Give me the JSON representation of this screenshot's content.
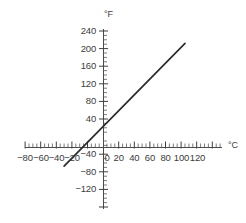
{
  "chart_data": {
    "type": "line",
    "title": "",
    "subtitle": "",
    "xlabel": "°C",
    "ylabel": "°F",
    "xlim": [
      -90,
      130
    ],
    "ylim": [
      -130,
      250
    ],
    "grid": false,
    "legend": null,
    "x_ticks": [
      -80,
      -60,
      -40,
      -20,
      0,
      20,
      40,
      60,
      80,
      100,
      120
    ],
    "x_tick_labels": [
      "−80",
      "−60",
      "−40",
      "−20",
      "0",
      "20",
      "40",
      "60",
      "80",
      "100",
      "120"
    ],
    "x_minor_step": 5,
    "y_ticks": [
      -120,
      -80,
      -40,
      0,
      40,
      80,
      120,
      160,
      200,
      240
    ],
    "y_tick_labels": [
      "−120",
      "−80",
      "−40",
      "",
      "40",
      "80",
      "120",
      "160",
      "200",
      "240"
    ],
    "y_minor_step": 10,
    "series": [
      {
        "name": "Fahrenheit vs Celsius",
        "color": "#2b2b2b",
        "equation": "F = 1.8C + 32",
        "slope": 1.8,
        "intercept": 32,
        "x": [
          -55,
          100
        ],
        "y": [
          -67,
          212
        ],
        "points": [
          {
            "c": -55,
            "f": -67
          },
          {
            "c": -40,
            "f": -40
          },
          {
            "c": -17.8,
            "f": 0
          },
          {
            "c": 0,
            "f": 32
          },
          {
            "c": 20,
            "f": 68
          },
          {
            "c": 40,
            "f": 104
          },
          {
            "c": 60,
            "f": 140
          },
          {
            "c": 80,
            "f": 176
          },
          {
            "c": 100,
            "f": 212
          }
        ]
      }
    ]
  },
  "axes": {
    "y_axis_title": "°F",
    "x_axis_title": "°C"
  },
  "y_labels": {
    "t240": "240",
    "t200": "200",
    "t160": "160",
    "t120": "120",
    "t80": "80",
    "t40": "40",
    "tm40": "−40",
    "tm80": "−80",
    "tm120": "−120"
  },
  "x_labels": {
    "tm80": "−80",
    "tm60": "−60",
    "tm40": "−40",
    "tm20": "−20",
    "t0": "0",
    "t20": "20",
    "t40": "40",
    "t60": "60",
    "t80": "80",
    "t100": "100",
    "t120": "120"
  },
  "colors": {
    "line": "#2b2b2b",
    "axis": "#4a4a4a",
    "text": "#3c3c3c",
    "background": "#ffffff"
  }
}
